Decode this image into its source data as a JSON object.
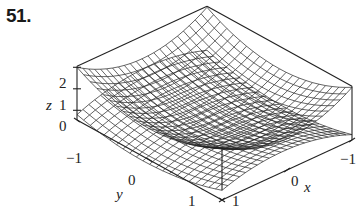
{
  "problem_number": "51.",
  "chart_data": {
    "type": "surface3d",
    "title": "",
    "surfaces": [
      {
        "name": "upper surface (bowl)",
        "equation": "z = x^2 + y^2",
        "shape": "paraboloid opening upward"
      },
      {
        "name": "lower surface",
        "equation": "z = -x^2 ... (parabolic cylinder / saddle-like, curving downward)",
        "shape": "surface bending downward toward edges"
      }
    ],
    "axes": {
      "x": {
        "label": "x",
        "ticks": [
          "1",
          "0",
          "−1"
        ],
        "range": [
          -1,
          1
        ]
      },
      "y": {
        "label": "y",
        "ticks": [
          "−1",
          "0",
          "1"
        ],
        "range": [
          -1,
          1
        ]
      },
      "z": {
        "label": "z",
        "ticks": [
          "0",
          "1",
          "2"
        ],
        "range": [
          -1,
          2
        ]
      }
    },
    "box": true,
    "grid": false,
    "legend": null
  },
  "labels": {
    "z_axis": "z",
    "z_ticks": [
      "2",
      "1",
      "0"
    ],
    "y_axis": "y",
    "y_ticks": [
      "−1",
      "0",
      "1"
    ],
    "x_axis": "x",
    "x_ticks": [
      "1",
      "0",
      "−1"
    ]
  }
}
